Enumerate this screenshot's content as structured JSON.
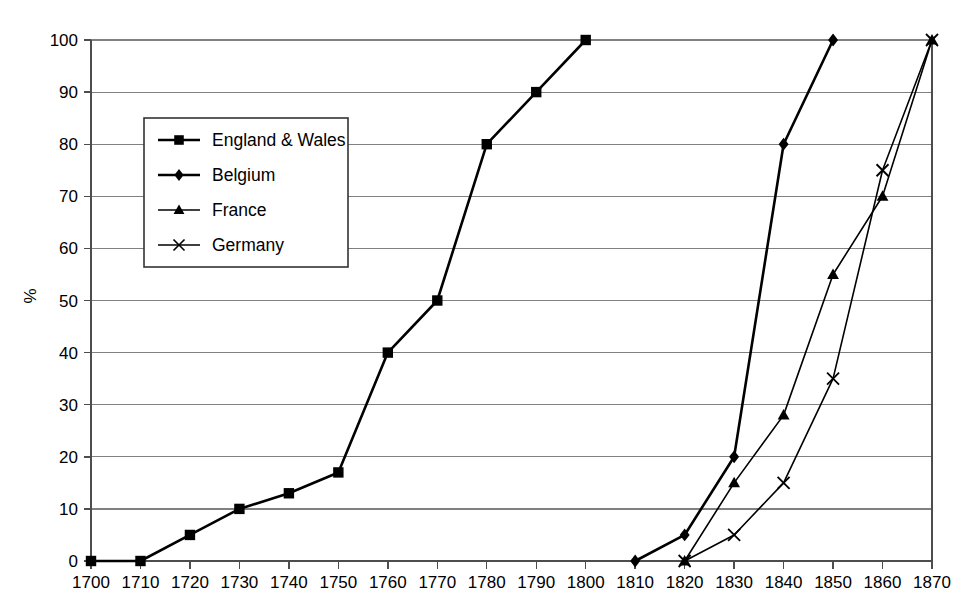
{
  "chart_data": {
    "type": "line",
    "title": "",
    "subtitle": "",
    "xlabel": "",
    "ylabel": "%",
    "xlim": [
      1700,
      1870
    ],
    "ylim": [
      0,
      100
    ],
    "grid": "horizontal",
    "legend_position": "upper-left-inside",
    "x": [
      1700,
      1710,
      1720,
      1730,
      1740,
      1750,
      1760,
      1770,
      1780,
      1790,
      1800,
      1810,
      1820,
      1830,
      1840,
      1850,
      1860,
      1870
    ],
    "xtick_labels": [
      "1700",
      "1710",
      "1720",
      "1730",
      "1740",
      "1750",
      "1760",
      "1770",
      "1780",
      "1790",
      "1800",
      "1810",
      "1820",
      "1830",
      "1840",
      "1850",
      "1860",
      "1870"
    ],
    "ytick_labels": [
      "0",
      "10",
      "20",
      "30",
      "40",
      "50",
      "60",
      "70",
      "80",
      "90",
      "100"
    ],
    "ytick_values": [
      0,
      10,
      20,
      30,
      40,
      50,
      60,
      70,
      80,
      90,
      100
    ],
    "series": [
      {
        "name": "England & Wales",
        "marker": "square",
        "points": [
          {
            "x": 1700,
            "y": 0
          },
          {
            "x": 1710,
            "y": 0
          },
          {
            "x": 1720,
            "y": 5
          },
          {
            "x": 1730,
            "y": 10
          },
          {
            "x": 1740,
            "y": 13
          },
          {
            "x": 1750,
            "y": 17
          },
          {
            "x": 1760,
            "y": 40
          },
          {
            "x": 1770,
            "y": 50
          },
          {
            "x": 1780,
            "y": 80
          },
          {
            "x": 1790,
            "y": 90
          },
          {
            "x": 1800,
            "y": 100
          }
        ]
      },
      {
        "name": "Belgium",
        "marker": "diamond",
        "points": [
          {
            "x": 1810,
            "y": 0
          },
          {
            "x": 1820,
            "y": 5
          },
          {
            "x": 1830,
            "y": 20
          },
          {
            "x": 1840,
            "y": 80
          },
          {
            "x": 1850,
            "y": 100
          }
        ]
      },
      {
        "name": "France",
        "marker": "triangle",
        "points": [
          {
            "x": 1820,
            "y": 0
          },
          {
            "x": 1830,
            "y": 15
          },
          {
            "x": 1840,
            "y": 28
          },
          {
            "x": 1850,
            "y": 55
          },
          {
            "x": 1860,
            "y": 70
          },
          {
            "x": 1870,
            "y": 100
          }
        ]
      },
      {
        "name": "Germany",
        "marker": "cross",
        "points": [
          {
            "x": 1820,
            "y": 0
          },
          {
            "x": 1830,
            "y": 5
          },
          {
            "x": 1840,
            "y": 15
          },
          {
            "x": 1850,
            "y": 35
          },
          {
            "x": 1860,
            "y": 75
          },
          {
            "x": 1870,
            "y": 100
          }
        ]
      }
    ],
    "legend": [
      {
        "label": "England & Wales",
        "marker": "square"
      },
      {
        "label": "Belgium",
        "marker": "diamond"
      },
      {
        "label": "France",
        "marker": "triangle"
      },
      {
        "label": "Germany",
        "marker": "cross"
      }
    ],
    "colors": {
      "series_line": "#000000",
      "gridline": "#808080",
      "axis": "#4d4d4d",
      "background": "#ffffff",
      "text": "#000000"
    }
  }
}
